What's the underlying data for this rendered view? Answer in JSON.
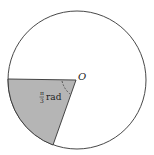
{
  "diagram": {
    "center_label": "O",
    "angle_label": {
      "numerator": "π",
      "denominator": "3",
      "unit": "rad"
    },
    "colors": {
      "stroke": "#333333",
      "sector_fill": "#b5b5b5",
      "background": "#ffffff"
    }
  }
}
